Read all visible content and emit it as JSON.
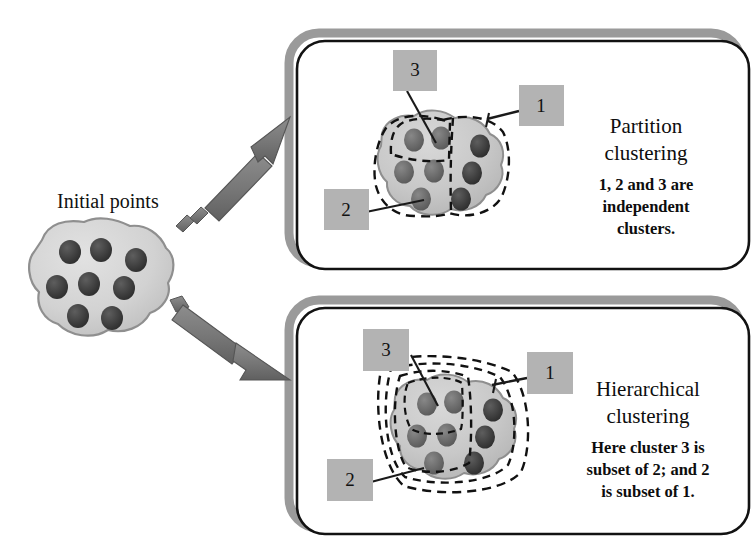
{
  "figure": {
    "background": "#ffffff",
    "source_label": "Initial points",
    "colors": {
      "blob_fill": "#c9c9c9",
      "blob_fill_light": "#d9d9d9",
      "blob_stroke": "#8a8a8a",
      "dot_fill": "#3a3a3a",
      "dot_fill_light": "#6e6e6e",
      "label_box_fill": "#b3b3b3",
      "panel_border": "#111111",
      "panel_shadow": "#9a9a9a",
      "arrow_fill": "#7a7a7a",
      "arrow_stroke": "#4a4a4a",
      "dash_stroke": "#111111",
      "leader_stroke": "#1a1a1a",
      "text": "#111111"
    }
  },
  "source": {
    "name": "initial-points",
    "caption": "Initial points",
    "point_count": 8,
    "points": [
      {
        "x": 70,
        "y": 253
      },
      {
        "x": 100,
        "y": 250
      },
      {
        "x": 135,
        "y": 259
      },
      {
        "x": 57,
        "y": 287
      },
      {
        "x": 88,
        "y": 283
      },
      {
        "x": 123,
        "y": 288
      },
      {
        "x": 76,
        "y": 315
      },
      {
        "x": 110,
        "y": 317
      }
    ]
  },
  "arrows": [
    {
      "name": "arrow-to-partition",
      "target": "Partition clustering",
      "direction": "up-right"
    },
    {
      "name": "arrow-to-hierarchical",
      "target": "Hierarchical clustering",
      "direction": "down-right"
    }
  ],
  "panels": [
    {
      "id": "partition",
      "title": "Partition\nclustering",
      "title_lines": [
        "Partition",
        "clustering"
      ],
      "body_lines": [
        "1, 2 and 3 are",
        "independent",
        "clusters."
      ],
      "body_text": "1, 2 and 3 are independent clusters.",
      "cluster_labels": [
        {
          "text": "1",
          "name": "cluster-label-1"
        },
        {
          "text": "2",
          "name": "cluster-label-2"
        },
        {
          "text": "3",
          "name": "cluster-label-3"
        }
      ],
      "point_count": 8,
      "cluster_type": "partition",
      "description": "Blob of points divided by dashed boundaries into three disjoint regions"
    },
    {
      "id": "hierarchical",
      "title": "Hierarchical\nclustering",
      "title_lines": [
        "Hierarchical",
        "clustering"
      ],
      "body_lines": [
        "Here cluster 3 is",
        "subset of 2; and 2",
        "is subset of 1."
      ],
      "body_text": "Here cluster 3 is subset of 2; and 2 is subset of 1.",
      "cluster_labels": [
        {
          "text": "1",
          "name": "cluster-label-1"
        },
        {
          "text": "2",
          "name": "cluster-label-2"
        },
        {
          "text": "3",
          "name": "cluster-label-3"
        }
      ],
      "point_count": 8,
      "cluster_type": "hierarchical",
      "description": "Blob of points enclosed by nested dashed boundaries, 3 inside 2 inside 1"
    }
  ]
}
